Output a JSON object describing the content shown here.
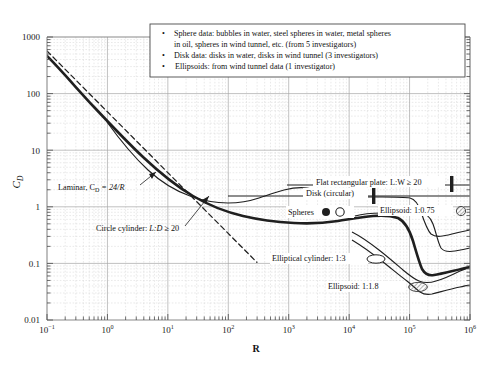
{
  "figure": {
    "name": "drag-coefficient-vs-reynolds-number",
    "xlabel": "R",
    "ylabel_main": "C",
    "ylabel_sub": "D"
  },
  "legend": {
    "bullet": "•",
    "items": [
      "Sphere data: bubbles in water, steel spheres in water, metal spheres",
      "in oil, spheres in wind tunnel, etc. (from 5 investigators)",
      "Disk data: disks in water, disks in wind tunnel (3 investigators)",
      "Ellipsoids: from wind tunnel data (1 investigator)"
    ],
    "line1": "Sphere data: bubbles in water, steel spheres in water, metal spheres",
    "line2": "in oil, spheres in wind tunnel, etc. (from 5 investigators)",
    "line3": "Disk data: disks in water, disks in wind tunnel (3 investigators)",
    "line4": "Ellipsoids: from wind tunnel data (1 investigator)"
  },
  "annotations": {
    "laminar": "Laminar, C",
    "laminar_sub": "D",
    "laminar_tail": " = 24/R",
    "circle_cylinder": "Circle cylinder: ",
    "circle_cylinder_it": "L:D",
    "circle_cylinder_tail": " ≥ 20",
    "flat_plate": "Flat rectangular plate: L:W ≥ 20",
    "disk": "Disk (circular)",
    "spheres": "Spheres",
    "ellipsoid_075": "Ellipsoid: 1:0.75",
    "elliptical_cylinder": "Elliptical cylinder: 1:3",
    "ellipsoid_118": "Ellipsoid: 1:1.8"
  },
  "axes": {
    "x_ticks": [
      {
        "base": "10",
        "exp": "−1"
      },
      {
        "base": "10",
        "exp": "0"
      },
      {
        "base": "10",
        "exp": "1"
      },
      {
        "base": "10",
        "exp": "2"
      },
      {
        "base": "10",
        "exp": "3"
      },
      {
        "base": "10",
        "exp": "4"
      },
      {
        "base": "10",
        "exp": "5"
      },
      {
        "base": "10",
        "exp": "6"
      }
    ],
    "y_ticks": [
      "1000",
      "100",
      "10",
      "1",
      "0.1",
      "0.01"
    ],
    "xlim": [
      -1,
      6
    ],
    "ylim": [
      -2,
      3
    ],
    "grid": true,
    "xscale": "log",
    "yscale": "log"
  },
  "colors": {
    "curve": "#1f1f1f",
    "grid_major": "#9a9a9a",
    "grid_minor": "#cfcfcf",
    "frame": "#8a8a8a",
    "text": "#121212"
  },
  "chart_data": {
    "type": "line",
    "title": "",
    "xlabel": "R",
    "ylabel": "C_D",
    "xscale": "log",
    "yscale": "log",
    "xlim": [
      0.1,
      1000000
    ],
    "ylim": [
      0.01,
      1000
    ],
    "grid": true,
    "legend_position": "top-right-box",
    "series": [
      {
        "name": "Spheres",
        "marker": "filled-circle, open-circle",
        "style": "thick solid",
        "x": [
          0.1,
          0.2,
          0.5,
          1,
          2,
          5,
          10,
          20,
          50,
          100,
          200,
          500,
          1000,
          2000,
          5000,
          10000,
          20000,
          50000,
          100000,
          200000,
          300000,
          400000,
          600000,
          1000000
        ],
        "y": [
          200,
          110,
          50,
          26,
          14.5,
          7.0,
          4.2,
          2.6,
          1.55,
          1.1,
          0.82,
          0.6,
          0.5,
          0.44,
          0.4,
          0.4,
          0.42,
          0.47,
          0.48,
          0.42,
          0.12,
          0.1,
          0.14,
          0.18
        ]
      },
      {
        "name": "Laminar, C_D = 24/R",
        "style": "dashed",
        "x": [
          0.1,
          1,
          10,
          100,
          300
        ],
        "y": [
          240,
          24,
          2.4,
          0.24,
          0.08
        ]
      },
      {
        "name": "Circle cylinder: L:D ≥ 20",
        "style": "thin solid",
        "x": [
          1,
          2,
          5,
          10,
          20,
          50,
          100,
          200,
          500,
          1000,
          2000,
          5000,
          10000,
          30000,
          100000,
          200000,
          300000,
          400000,
          600000,
          1000000
        ],
        "y": [
          11.0,
          7.0,
          4.0,
          2.9,
          2.1,
          1.55,
          1.35,
          1.25,
          1.05,
          1.0,
          1.05,
          1.15,
          1.2,
          1.2,
          1.2,
          1.18,
          0.95,
          0.35,
          0.35,
          0.45
        ]
      },
      {
        "name": "Disk (circular)",
        "style": "thin solid horizontal",
        "x": [
          1000,
          1000000
        ],
        "y": [
          1.12,
          1.12
        ]
      },
      {
        "name": "Flat rectangular plate: L:W ≥ 20",
        "style": "thin solid horizontal",
        "x": [
          1000,
          1000000
        ],
        "y": [
          1.95,
          1.95
        ]
      },
      {
        "name": "Ellipsoid: 1:0.75",
        "style": "thin solid",
        "marker": "hatched-circle",
        "x": [
          20000,
          50000,
          100000,
          200000,
          300000,
          400000,
          600000,
          1000000
        ],
        "y": [
          0.6,
          0.6,
          0.6,
          0.6,
          0.58,
          0.22,
          0.21,
          0.26
        ]
      },
      {
        "name": "Elliptical cylinder: 1:3",
        "style": "thin solid",
        "marker": "open-ellipse",
        "x": [
          20000,
          50000,
          100000,
          150000,
          200000,
          300000,
          600000,
          1000000
        ],
        "y": [
          0.3,
          0.25,
          0.2,
          0.15,
          0.13,
          0.12,
          0.15,
          0.2
        ]
      },
      {
        "name": "Ellipsoid: 1:1.8",
        "style": "thin solid",
        "marker": "hatched-ellipse",
        "x": [
          20000,
          50000,
          100000,
          200000,
          300000,
          500000,
          1000000
        ],
        "y": [
          0.23,
          0.18,
          0.13,
          0.1,
          0.062,
          0.07,
          0.085
        ]
      }
    ]
  }
}
